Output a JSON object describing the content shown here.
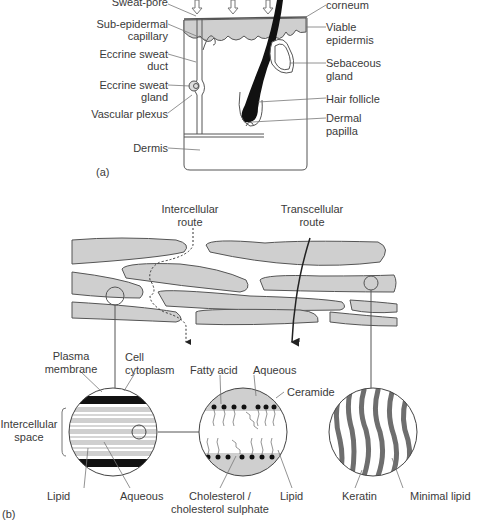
{
  "panel_a": {
    "tag": "(a)",
    "left_labels": {
      "sweat_pore": "Sweat-pore",
      "sub_epidermal_1": "Sub-epidermal",
      "sub_epidermal_2": "capillary",
      "eccrine_duct_1": "Eccrine sweat",
      "eccrine_duct_2": "duct",
      "eccrine_gland_1": "Eccrine sweat",
      "eccrine_gland_2": "gland",
      "vascular_plexus": "Vascular plexus",
      "dermis": "Dermis"
    },
    "right_labels": {
      "stratum_corneum": "corneum",
      "viable_1": "Viable",
      "viable_2": "epidermis",
      "sebaceous_1": "Sebaceous",
      "sebaceous_2": "gland",
      "hair_follicle": "Hair follicle",
      "dermal_1": "Dermal",
      "dermal_2": "papilla"
    }
  },
  "panel_b": {
    "tag": "(b)",
    "routes": {
      "intercellular_1": "Intercellular",
      "intercellular_2": "route",
      "transcellular_1": "Transcellular",
      "transcellular_2": "route"
    },
    "circle1": {
      "plasma_1": "Plasma",
      "plasma_2": "membrane",
      "cell_1": "Cell",
      "cell_2": "cytoplasm",
      "space_1": "Intercellular",
      "space_2": "space",
      "lipid": "Lipid",
      "aqueous": "Aqueous"
    },
    "circle2": {
      "fatty_acid": "Fatty acid",
      "aqueous": "Aqueous",
      "ceramide": "Ceramide",
      "chol_1": "Cholesterol /",
      "chol_2": "cholesterol sulphate",
      "lipid": "Lipid"
    },
    "circle3": {
      "keratin": "Keratin",
      "minimal_lipid": "Minimal lipid"
    }
  },
  "colors": {
    "ink": "#3a3a3a",
    "gray_fill": "#cfcfcf",
    "dark_band": "#111111",
    "keratin": "#6e6e6e"
  }
}
